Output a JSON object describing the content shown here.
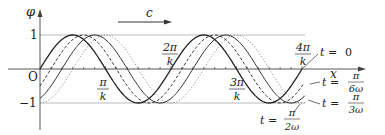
{
  "diagram": {
    "axes": {
      "y_label": "φ",
      "x_label": "x",
      "origin_label": "O",
      "y_ticks": [
        {
          "value": 1,
          "label": "1"
        },
        {
          "value": -1,
          "label": "−1"
        }
      ],
      "x_ticks": [
        {
          "num": "π",
          "den": "k"
        },
        {
          "num": "2π",
          "den": "k"
        },
        {
          "num": "3π",
          "den": "k"
        },
        {
          "num": "4π",
          "den": "k"
        }
      ]
    },
    "velocity_arrow": {
      "label": "c",
      "direction": "right"
    },
    "curves": [
      {
        "label_lhs": "t = ",
        "label_value": "0",
        "style": "solid"
      },
      {
        "label_lhs": "t = ",
        "num": "π",
        "den": "6ω",
        "style": "dashed"
      },
      {
        "label_lhs": "t = ",
        "num": "π",
        "den": "3ω",
        "style": "solid-thin"
      },
      {
        "label_lhs": "t = ",
        "num": "π",
        "den": "2ω",
        "style": "dotted"
      }
    ]
  }
}
